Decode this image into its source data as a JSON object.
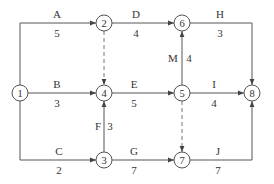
{
  "diagram": {
    "type": "activity-on-arrow network",
    "colors": {
      "line": "#555555",
      "text": "#333333",
      "dashed": "#777777",
      "background": "#ffffff"
    },
    "nodes": [
      {
        "id": "1",
        "label": "1",
        "x": 20,
        "y": 93
      },
      {
        "id": "2",
        "label": "2",
        "x": 104,
        "y": 23
      },
      {
        "id": "3",
        "label": "3",
        "x": 104,
        "y": 160
      },
      {
        "id": "4",
        "label": "4",
        "x": 104,
        "y": 93
      },
      {
        "id": "5",
        "label": "5",
        "x": 182,
        "y": 93
      },
      {
        "id": "6",
        "label": "6",
        "x": 182,
        "y": 23
      },
      {
        "id": "7",
        "label": "7",
        "x": 182,
        "y": 160
      },
      {
        "id": "8",
        "label": "8",
        "x": 252,
        "y": 93
      }
    ],
    "activities": [
      {
        "name": "A",
        "duration": "5",
        "from": "1",
        "to": "2"
      },
      {
        "name": "B",
        "duration": "3",
        "from": "1",
        "to": "4"
      },
      {
        "name": "C",
        "duration": "2",
        "from": "1",
        "to": "3"
      },
      {
        "name": "D",
        "duration": "4",
        "from": "2",
        "to": "6"
      },
      {
        "name": "E",
        "duration": "5",
        "from": "4",
        "to": "5"
      },
      {
        "name": "F",
        "duration": "3",
        "from": "3",
        "to": "4"
      },
      {
        "name": "G",
        "duration": "7",
        "from": "3",
        "to": "7"
      },
      {
        "name": "H",
        "duration": "3",
        "from": "6",
        "to": "8"
      },
      {
        "name": "I",
        "duration": "4",
        "from": "5",
        "to": "8"
      },
      {
        "name": "J",
        "duration": "7",
        "from": "7",
        "to": "8"
      },
      {
        "name": "M",
        "duration": "4",
        "from": "5",
        "to": "6"
      }
    ],
    "dummy_activities": [
      {
        "from": "2",
        "to": "4"
      },
      {
        "from": "5",
        "to": "7"
      }
    ]
  }
}
